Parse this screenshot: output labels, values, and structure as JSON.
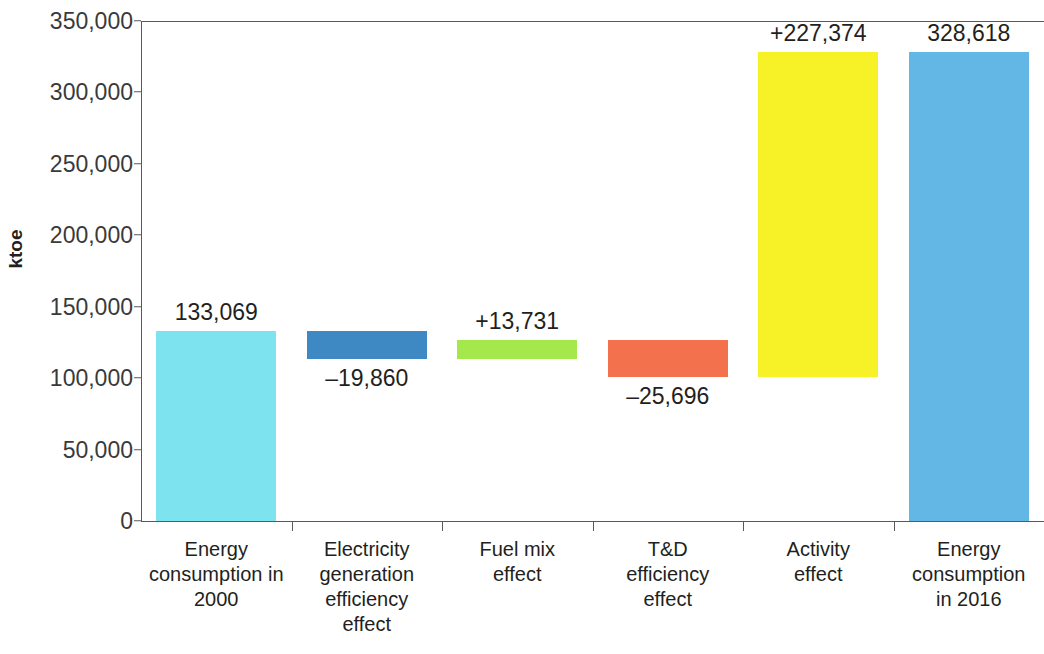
{
  "chart_data": {
    "type": "bar",
    "chart_subtype": "waterfall",
    "title": "",
    "xlabel": "",
    "ylabel": "ktoe",
    "ylim": [
      0,
      350000
    ],
    "ytick_values": [
      0,
      50000,
      100000,
      150000,
      200000,
      250000,
      300000,
      350000
    ],
    "ytick_labels": [
      "0",
      "50,000",
      "100,000",
      "150,000",
      "200,000",
      "250,000",
      "300,000",
      "350,000"
    ],
    "grid": false,
    "legend": "none",
    "categories": [
      "Energy consumption in 2000",
      "Electricity generation efficiency effect",
      "Fuel mix effect",
      "T&D efficiency effect",
      "Activity effect",
      "Energy consumption in 2016"
    ],
    "values": [
      133069,
      -19860,
      13731,
      -25696,
      227374,
      328618
    ],
    "data_labels": [
      "133,069",
      "–19,860",
      "+13,731",
      "–25,696",
      "+227,374",
      "328,618"
    ],
    "bar_bases": [
      0,
      113209,
      113209,
      100862,
      100862,
      0
    ],
    "bar_tops": [
      133069,
      133069,
      126940,
      126558,
      328236,
      328618
    ],
    "bar_kinds": [
      "total",
      "decrease",
      "increase",
      "decrease",
      "increase",
      "total"
    ],
    "colors": [
      "#7de4ef",
      "#3e89c4",
      "#a5e84b",
      "#f4714e",
      "#f7f128",
      "#62b7e4"
    ],
    "label_positions": [
      "above",
      "below",
      "above",
      "below",
      "above",
      "above"
    ],
    "axis_color": "#5a5a5a",
    "text_color": "#231f20"
  },
  "category_label_lines": [
    [
      "Energy",
      "consumption in",
      "2000"
    ],
    [
      "Electricity",
      "generation",
      "efficiency",
      "effect"
    ],
    [
      "Fuel mix",
      "effect"
    ],
    [
      "T&D",
      "efficiency",
      "effect"
    ],
    [
      "Activity",
      "effect"
    ],
    [
      "Energy",
      "consumption",
      "in 2016"
    ]
  ]
}
